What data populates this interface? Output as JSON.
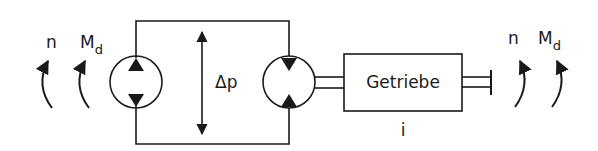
{
  "diagram": {
    "colors": {
      "line": "#1a1a1a",
      "background": "#ffffff"
    },
    "left": {
      "speed_label": "n",
      "torque_label": "M",
      "torque_subscript": "d"
    },
    "pressure_label": "Δp",
    "gearbox": {
      "label": "Getriebe",
      "ratio_label": "i"
    },
    "right": {
      "speed_label": "n",
      "torque_label": "M",
      "torque_subscript": "d"
    }
  }
}
